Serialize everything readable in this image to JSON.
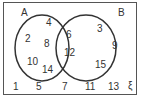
{
  "diagram": {
    "type": "venn",
    "universal_symbol": "ξ",
    "sets": [
      {
        "name": "A",
        "label": "A"
      },
      {
        "name": "B",
        "label": "B"
      }
    ],
    "regions": {
      "A_only": [
        "4",
        "2",
        "8",
        "10",
        "14"
      ],
      "A_and_B": [
        "6",
        "12"
      ],
      "B_only": [
        "3",
        "9",
        "15"
      ],
      "outside": [
        "1",
        "5",
        "7",
        "11",
        "13"
      ]
    },
    "colors": {
      "stroke": "#333333",
      "text": "#333333",
      "background": "#ffffff"
    }
  }
}
